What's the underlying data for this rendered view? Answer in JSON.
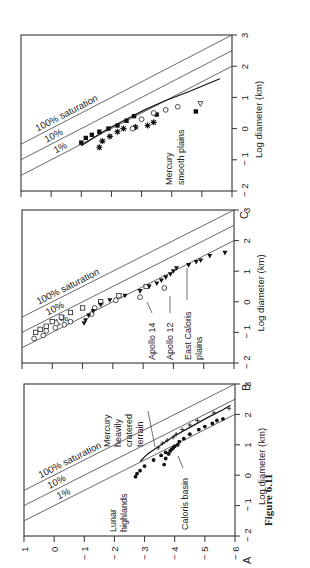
{
  "figure_label": "Figure 6.11",
  "orientation": "rotated 90deg counterclockwise",
  "chart_data": [
    {
      "panel": "A",
      "type": "scatter",
      "xlabel": "Log diameter (km)",
      "ylabel": "",
      "x_ticks": [
        "-2",
        "-1",
        "0",
        "1",
        "2",
        "3"
      ],
      "y_ticks": [
        "1",
        "0",
        "-1",
        "-2",
        "-3",
        "-4",
        "-5",
        "-6"
      ],
      "xlim": [
        -2,
        3
      ],
      "ylim": [
        -6,
        1
      ],
      "reference_lines": [
        {
          "label": "100% saturation",
          "intercept": 0,
          "slope": -2
        },
        {
          "label": "10%",
          "intercept": -1,
          "slope": -2
        },
        {
          "label": "1%",
          "intercept": -2,
          "slope": -2
        }
      ],
      "annotations": [
        "Lunar highlands",
        "Mercury heavily cratered terrain",
        "Caloris basin"
      ],
      "series": [
        {
          "name": "Lunar highlands (curve)",
          "style": "line",
          "x": [
            0.45,
            0.7,
            1.0,
            1.3,
            1.6,
            1.9,
            2.15,
            2.3
          ],
          "y": [
            -2.85,
            -3.1,
            -3.55,
            -4.0,
            -4.55,
            -5.1,
            -5.6,
            -5.85
          ]
        },
        {
          "name": "Mercury heavily cratered terrain",
          "style": "cross",
          "x": [
            0.9,
            1.05,
            1.15,
            1.25,
            1.35,
            1.5,
            1.65,
            1.8,
            2.05,
            2.2
          ],
          "y": [
            -3.45,
            -3.6,
            -3.75,
            -3.95,
            -4.05,
            -4.25,
            -4.5,
            -4.75,
            -5.3,
            -5.8
          ]
        },
        {
          "name": "Caloris basin",
          "style": "filled-circle",
          "x": [
            -0.05,
            0.05,
            0.15,
            0.3,
            0.35,
            0.5,
            0.55,
            0.65,
            0.7,
            0.75,
            0.8,
            0.85,
            0.9,
            0.95,
            1.0,
            1.1,
            1.2,
            1.35,
            1.5,
            1.6,
            1.7,
            1.8,
            1.85
          ],
          "y": [
            -2.7,
            -2.75,
            -2.85,
            -3.0,
            -3.65,
            -3.3,
            -3.7,
            -3.55,
            -3.8,
            -3.7,
            -3.85,
            -3.9,
            -3.95,
            -4.0,
            -4.1,
            -4.15,
            -4.3,
            -4.5,
            -4.8,
            -5.0,
            -5.25,
            -5.4,
            -5.6
          ]
        }
      ]
    },
    {
      "panel": "B",
      "type": "scatter",
      "xlabel": "Log diameter (km)",
      "ylabel": "",
      "x_ticks": [
        "-2",
        "-1",
        "0",
        "1",
        "2",
        "3"
      ],
      "xlim": [
        -2,
        3
      ],
      "ylim": [
        -6,
        1
      ],
      "reference_lines": [
        {
          "label": "100% saturation",
          "intercept": 0,
          "slope": -2
        },
        {
          "label": "10%",
          "intercept": -1,
          "slope": -2
        },
        {
          "label": "1%",
          "intercept": -2,
          "slope": -2
        }
      ],
      "annotations": [
        "Apollo 14",
        "Apollo 12",
        "East Caloris plains"
      ],
      "series": [
        {
          "name": "Apollo 14",
          "style": "open-square",
          "x": [
            -1.0,
            -0.9,
            -0.8,
            -0.65,
            -0.5,
            -0.35,
            -0.2,
            0.0,
            0.2,
            0.5
          ],
          "y": [
            0.55,
            0.4,
            0.2,
            0.0,
            -0.3,
            -0.6,
            -1.0,
            -1.6,
            -2.2,
            -3.1
          ]
        },
        {
          "name": "Apollo 12",
          "style": "open-circle",
          "x": [
            -1.2,
            -1.1,
            -0.95,
            -0.85,
            -0.75,
            -0.65,
            -0.4,
            -0.2,
            0.05,
            0.15,
            0.45
          ],
          "y": [
            0.6,
            0.3,
            0.2,
            -0.1,
            -0.4,
            -0.6,
            -1.3,
            -1.4,
            -2.1,
            -2.9,
            -3.7
          ]
        },
        {
          "name": "East Caloris plains",
          "style": "filled-triangle",
          "x": [
            -0.7,
            -0.6,
            -0.45,
            -0.3,
            -0.1,
            0.05,
            0.2,
            0.35,
            0.5,
            0.6,
            0.7,
            0.8,
            0.9,
            1.0,
            1.1,
            1.2,
            1.3,
            1.35,
            1.5,
            1.6
          ],
          "y": [
            -1.05,
            -1.1,
            -1.2,
            -1.35,
            -1.6,
            -1.9,
            -2.4,
            -2.9,
            -3.2,
            -3.45,
            -3.6,
            -3.75,
            -3.9,
            -4.0,
            -4.1,
            -4.5,
            -4.75,
            -4.9,
            -5.2,
            -5.7
          ]
        }
      ]
    },
    {
      "panel": "C",
      "type": "scatter",
      "xlabel": "Log diameter (km)",
      "ylabel": "",
      "x_ticks": [
        "-2",
        "-1",
        "0",
        "1",
        "2",
        "3"
      ],
      "xlim": [
        -2,
        3
      ],
      "ylim": [
        -6,
        1
      ],
      "reference_lines": [
        {
          "label": "100% saturation",
          "intercept": 0,
          "slope": -2
        },
        {
          "label": "10%",
          "intercept": -1,
          "slope": -2
        },
        {
          "label": "1%",
          "intercept": -2,
          "slope": -2
        }
      ],
      "annotations": [
        "Mercury smooth plains"
      ],
      "series": [
        {
          "name": "Smooth plains curve",
          "style": "line",
          "x": [
            -0.55,
            -0.3,
            0.0,
            0.3,
            0.6,
            0.9,
            1.2,
            1.6
          ],
          "y": [
            -1.0,
            -1.4,
            -1.9,
            -2.5,
            -3.1,
            -3.8,
            -4.6,
            -5.6
          ]
        },
        {
          "name": "Filled squares",
          "style": "filled-square",
          "x": [
            -0.45,
            -0.3,
            -0.2,
            -0.1,
            0.0,
            0.1,
            0.25,
            0.4,
            0.45,
            0.55
          ],
          "y": [
            -1.0,
            -1.15,
            -1.35,
            -1.6,
            -1.9,
            -2.2,
            -2.5,
            -2.75,
            -3.5,
            -4.8
          ]
        },
        {
          "name": "Asterisks",
          "style": "asterisk",
          "x": [
            -0.6,
            -0.4,
            -0.25,
            -0.1,
            0.0,
            0.05,
            0.1,
            0.2
          ],
          "y": [
            -1.6,
            -1.7,
            -1.95,
            -2.2,
            -2.4,
            -2.8,
            -3.2,
            -3.4
          ]
        },
        {
          "name": "Open circles",
          "style": "open-circle",
          "x": [
            0.0,
            0.3,
            0.5,
            0.6,
            0.7
          ],
          "y": [
            -2.7,
            -3.0,
            -3.4,
            -3.8,
            -4.2
          ]
        },
        {
          "name": "Open triangle",
          "style": "open-triangle",
          "x": [
            0.8
          ],
          "y": [
            -4.95
          ]
        }
      ]
    }
  ],
  "panels": {
    "A": {
      "letter": "A",
      "xlabel": "Log diameter (km)",
      "line_labels": [
        "100% saturation",
        "10%",
        "1%"
      ],
      "ann_lunar": [
        "Lunar",
        "highlands"
      ],
      "ann_mercury": [
        "Mercury",
        "heavily",
        "cratered",
        "terrain"
      ],
      "ann_caloris": "Caloris basin"
    },
    "B": {
      "letter": "B",
      "xlabel": "Log diameter (km)",
      "line_labels": [
        "100% saturation",
        "10%",
        "1%"
      ],
      "ann_apollo14": "Apollo 14",
      "ann_apollo12": "Apollo 12",
      "ann_east": [
        "East Caloris",
        "plains"
      ]
    },
    "C": {
      "letter": "C",
      "xlabel": "Log diameter (km)",
      "line_labels": [
        "100% saturation",
        "10%",
        "1%"
      ],
      "ann_mercury": [
        "Mercury",
        "smooth plains"
      ]
    }
  }
}
